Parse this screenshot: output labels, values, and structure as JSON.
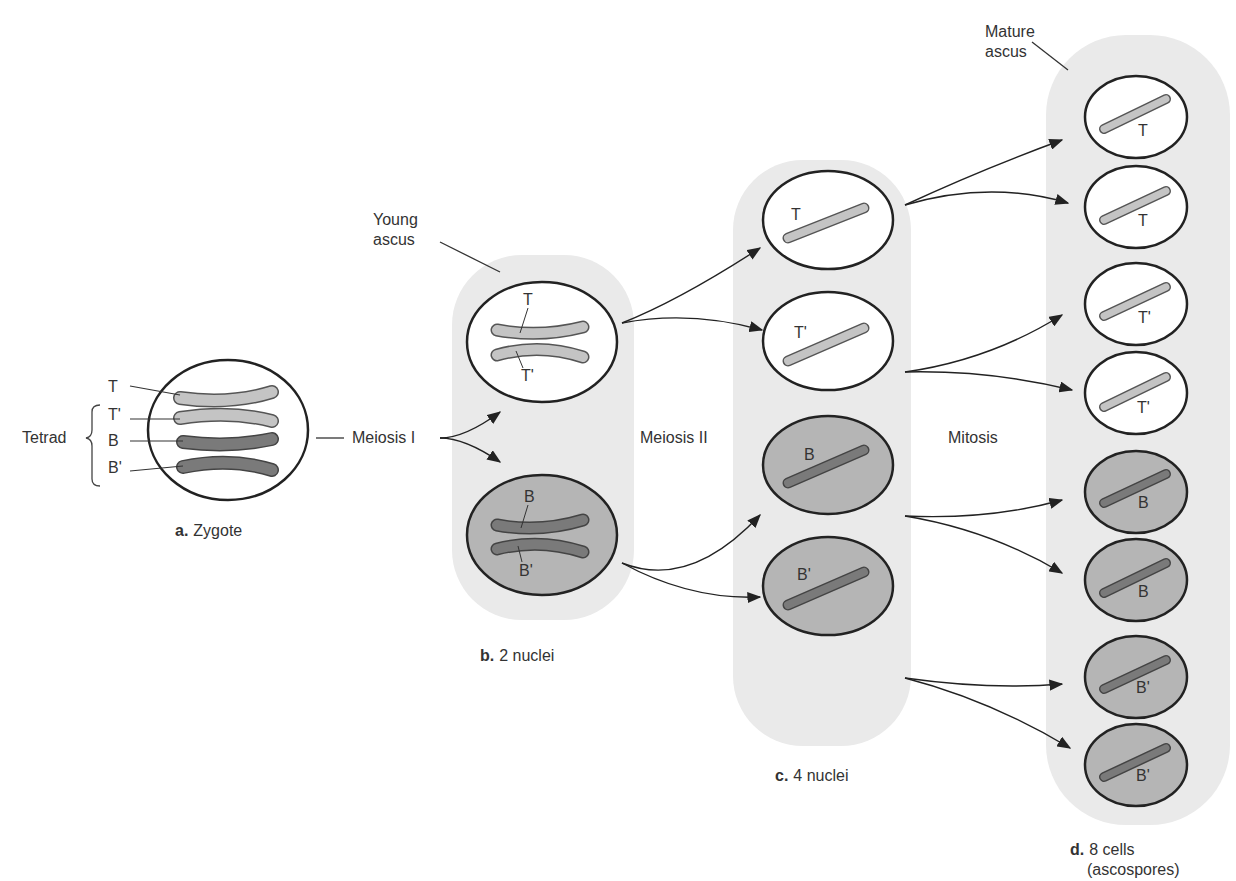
{
  "labels": {
    "tetrad": "Tetrad",
    "chromatids": [
      "T",
      "T'",
      "B",
      "B'"
    ],
    "young_ascus": [
      "Young",
      "ascus"
    ],
    "mature_ascus": [
      "Mature",
      "ascus"
    ],
    "meiosis1": "Meiosis I",
    "meiosis2": "Meiosis II",
    "mitosis": "Mitosis"
  },
  "stages": {
    "a": {
      "letter": "a.",
      "text": "Zygote"
    },
    "b": {
      "letter": "b.",
      "text": "2 nuclei"
    },
    "c": {
      "letter": "c.",
      "text": "4 nuclei"
    },
    "d": {
      "letter": "d.",
      "text": "8 cells",
      "text2": "(ascospores)"
    }
  },
  "nuclei_b": [
    "T",
    "T'",
    "B",
    "B'"
  ],
  "nuclei_c": [
    "T",
    "T'",
    "B",
    "B'"
  ],
  "cells_d": [
    "T",
    "T",
    "T'",
    "T'",
    "B",
    "B",
    "B'",
    "B'"
  ],
  "colors": {
    "light_chromosome": "#c4c4c4",
    "dark_chromosome": "#7a7a7a",
    "dark_nucleus": "#b5b5b5",
    "ascus_bg": "#eaeaea",
    "outline": "#222222"
  }
}
